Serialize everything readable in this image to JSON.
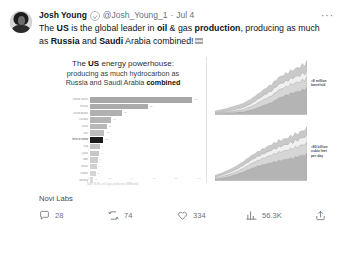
{
  "tweet": {
    "author": {
      "display_name": "Josh Young",
      "handle": "@Josh_Young_1",
      "separator": "·",
      "date": "Jul 4",
      "verified_icon": "verified-badge-icon",
      "avatar_icon": "profile-photo"
    },
    "more_button": "···",
    "text": {
      "segment_1": "The ",
      "bold_1": "US",
      "segment_2": " is the global leader in ",
      "bold_2": "oil",
      "segment_3": " & gas ",
      "bold_3": "production",
      "segment_4": ", producing as much as ",
      "bold_4": "Russia",
      "segment_5": " and ",
      "bold_5": "Saudi",
      "segment_6": " Arabia combined!"
    },
    "credit": "Novi Labs",
    "actions": [
      {
        "name": "reply",
        "icon": "comment-icon",
        "count": "28"
      },
      {
        "name": "repost",
        "icon": "retweet-icon",
        "count": "74"
      },
      {
        "name": "like",
        "icon": "heart-icon",
        "count": "334"
      },
      {
        "name": "views",
        "icon": "analytics-icon",
        "count": "56.3K"
      },
      {
        "name": "share",
        "icon": "share-icon",
        "count": ""
      }
    ]
  },
  "chart_data": [
    {
      "type": "bar",
      "orientation": "horizontal",
      "title_line1": "The US energy powerhouse:",
      "title_line1_bold": "US",
      "title_line2": "producing as much hydrocarbon as",
      "title_line3_a": "Russia and Saudi Arabia ",
      "title_line3_bold": "combined",
      "source_note": "Note: BOE = oil & gas production (MMboe/d)",
      "xlabel": "",
      "ylabel": "",
      "xlim": [
        0,
        100
      ],
      "grid": false,
      "highlight_index": 6,
      "categories": [
        "United States",
        "Russia",
        "Saudi Arabia",
        "Canada",
        "China",
        "Iran",
        "Rest of World",
        "Iraq",
        "Qatar",
        "UAE",
        "Brazil",
        "Kuwait",
        "Norway"
      ],
      "values": [
        92,
        52,
        29,
        19,
        15,
        13,
        12,
        9,
        8,
        7,
        6,
        5,
        3
      ],
      "tick_labels": [
        "0",
        "20",
        "40",
        "60",
        "80",
        "100"
      ]
    },
    {
      "type": "area",
      "stacked": true,
      "title": "",
      "annotation_line1": "≈8 million",
      "annotation_line2": "barrels/d",
      "xlabel": "",
      "ylabel": "",
      "series": [
        {
          "name": "Permian",
          "values": [
            2,
            3,
            4,
            5,
            6,
            9,
            13,
            18,
            22,
            30,
            35,
            40,
            44,
            50
          ]
        },
        {
          "name": "Eagle Ford",
          "values": [
            1,
            2,
            2,
            3,
            4,
            6,
            8,
            10,
            12,
            14,
            15,
            16,
            17,
            18
          ]
        },
        {
          "name": "Bakken",
          "values": [
            1,
            1,
            2,
            3,
            4,
            5,
            7,
            8,
            9,
            10,
            10,
            11,
            12,
            13
          ]
        },
        {
          "name": "Other basins",
          "values": [
            3,
            4,
            5,
            6,
            7,
            8,
            9,
            10,
            11,
            12,
            13,
            14,
            15,
            16
          ]
        }
      ]
    },
    {
      "type": "area",
      "stacked": true,
      "title": "",
      "annotation_line1": "≈80 billion",
      "annotation_line2": "cubic feet",
      "annotation_line3": "per day",
      "xlabel": "",
      "ylabel": "",
      "series": [
        {
          "name": "Appalachia",
          "values": [
            4,
            6,
            9,
            13,
            18,
            24,
            29,
            33,
            37,
            41,
            44,
            47,
            50,
            53
          ]
        },
        {
          "name": "Permian gas",
          "values": [
            2,
            3,
            4,
            5,
            7,
            9,
            11,
            13,
            15,
            17,
            18,
            19,
            20,
            21
          ]
        },
        {
          "name": "Haynesville",
          "values": [
            2,
            3,
            4,
            5,
            6,
            7,
            8,
            9,
            10,
            11,
            12,
            13,
            14,
            15
          ]
        },
        {
          "name": "Other gas",
          "values": [
            3,
            4,
            5,
            6,
            7,
            8,
            9,
            10,
            11,
            12,
            12,
            13,
            13,
            14
          ]
        }
      ]
    }
  ]
}
